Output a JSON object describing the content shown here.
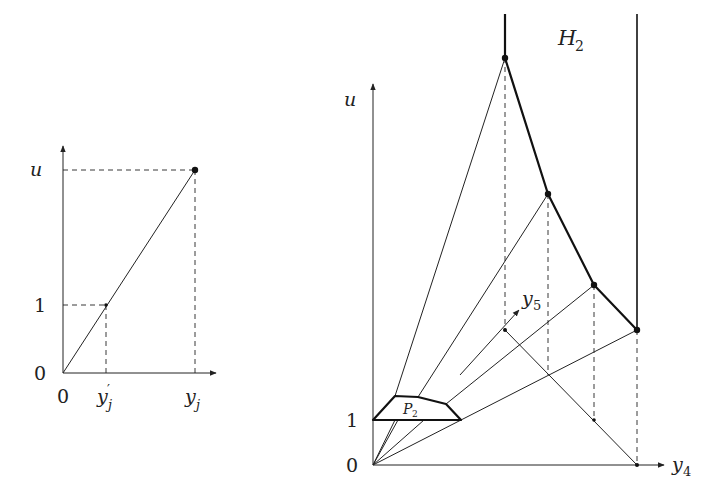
{
  "left_plot": {
    "labels": {
      "y_axis": "u",
      "y_one": "1",
      "y_zero": "0",
      "x_zero": "0",
      "x_prime": "y",
      "x_prime_sub": "j",
      "x_prime_mark": "′",
      "x_full": "y",
      "x_full_sub": "j"
    }
  },
  "right_plot": {
    "labels": {
      "title": "H",
      "title_sub": "2",
      "y_axis": "u",
      "y_one": "1",
      "y_zero": "0",
      "x_axis": "y",
      "x_axis_sub": "4",
      "z_axis": "y",
      "z_axis_sub": "5",
      "polygon": "P",
      "polygon_sub": "2"
    }
  },
  "colors": {
    "stroke": "#222222",
    "background": "#ffffff"
  }
}
